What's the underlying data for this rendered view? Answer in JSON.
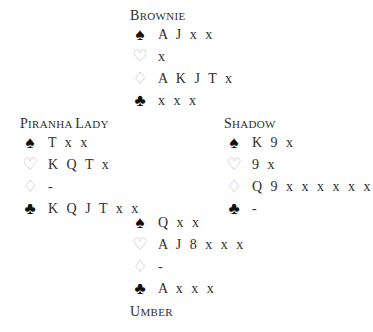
{
  "hands": {
    "north": {
      "name_first": "B",
      "name_rest": "rownie",
      "spades": "A J x x",
      "hearts": "x",
      "diamonds": "A K J T x",
      "clubs": "x x x"
    },
    "west": {
      "name_first": "P",
      "name_rest": "iranha ",
      "name2_first": "L",
      "name2_rest": "ady",
      "spades": "T x x",
      "hearts": "K Q T x",
      "diamonds": "-",
      "clubs": "K Q J T x x"
    },
    "east": {
      "name_first": "S",
      "name_rest": "hadow",
      "spades": "K 9 x",
      "hearts": "9 x",
      "diamonds": "Q 9 x x x x x x",
      "clubs": "-"
    },
    "south": {
      "name_first": "U",
      "name_rest": "mber",
      "spades": "Q x x",
      "hearts": "A J 8 x x x",
      "diamonds": "-",
      "clubs": "A x x x"
    }
  },
  "suits": {
    "spades": "♠",
    "hearts": "♡",
    "diamonds": "♢",
    "clubs": "♣"
  }
}
